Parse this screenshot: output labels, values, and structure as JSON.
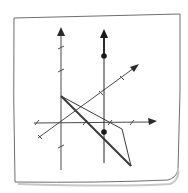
{
  "diagram": {
    "title": "",
    "colors": {
      "background": "#ffffff",
      "paper": "#ffffff",
      "paper_border": "#6e6e6e",
      "paper_shadow": "#c8c8c8",
      "axis": "#4a4a4a",
      "line": "#2a2a2a",
      "plane": "#3a3a3a",
      "point": "#1a1a1a"
    },
    "elements": [
      {
        "id": "z-axis",
        "type": "axis",
        "label": ""
      },
      {
        "id": "x-axis",
        "type": "axis",
        "label": ""
      },
      {
        "id": "y-axis",
        "type": "axis",
        "label": ""
      },
      {
        "id": "vertical-line",
        "type": "line",
        "label": ""
      },
      {
        "id": "point-upper",
        "type": "point",
        "label": ""
      },
      {
        "id": "point-lower",
        "type": "point",
        "label": ""
      },
      {
        "id": "plane-triangle",
        "type": "polygon",
        "label": ""
      }
    ]
  }
}
